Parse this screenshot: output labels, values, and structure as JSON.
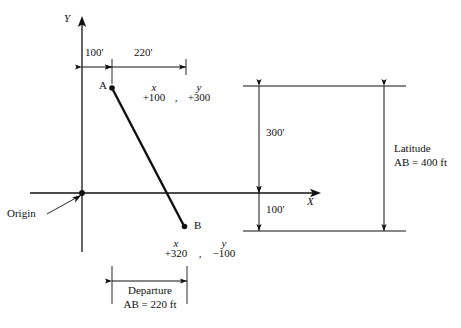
{
  "diagram": {
    "axes": {
      "y_label": "Y",
      "x_label": "X",
      "origin_label": "Origin"
    },
    "points": [
      {
        "name": "A",
        "label": "A",
        "x_header": "x",
        "y_header": "y",
        "separator": ",",
        "x_value": "+100",
        "y_value": "+300"
      },
      {
        "name": "B",
        "label": "B",
        "x_header": "x",
        "y_header": "y",
        "separator": ",",
        "x_value": "+320",
        "y_value": "−100"
      }
    ],
    "dimensions": {
      "top_left": "100'",
      "top_right": "220'",
      "vertical_upper": "300'",
      "vertical_lower": "100'",
      "latitude_line1": "Latitude",
      "latitude_line2": "AB = 400 ft",
      "departure_line1": "Departure",
      "departure_line2": "AB = 220 ft"
    },
    "colors": {
      "ink": "#111111",
      "paper": "#ffffff",
      "rule": "#333333"
    }
  }
}
